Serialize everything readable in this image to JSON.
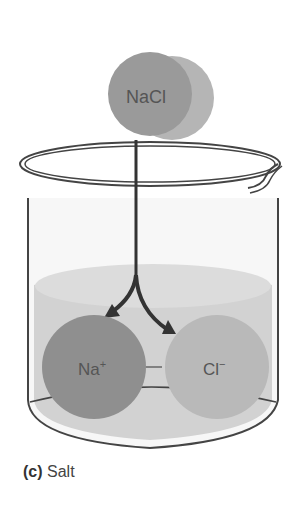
{
  "figure": {
    "compound_label": "NaCl",
    "ions": [
      {
        "label": "Na",
        "charge": "+",
        "color": "#8f8f8f"
      },
      {
        "label": "Cl",
        "charge": "−",
        "color": "#b9b9b9"
      }
    ],
    "caption_letter": "(c)",
    "caption_text": "Salt",
    "colors": {
      "nacl_front": "#9a9a9a",
      "nacl_back": "#b5b5b5",
      "liquid": "#d2d2d2",
      "arrow": "#333333",
      "beaker_outline": "#444444"
    }
  }
}
